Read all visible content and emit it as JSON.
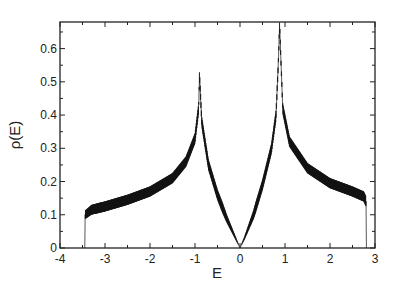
{
  "chart_data": {
    "type": "line",
    "title": "",
    "xlabel": "E",
    "ylabel": "ρ(E)",
    "xlim": [
      -4,
      3
    ],
    "ylim": [
      0,
      0.68
    ],
    "grid": false,
    "legend": null,
    "x_ticks": [
      -4,
      -3,
      -2,
      -1,
      0,
      1,
      2,
      3
    ],
    "x_tick_labels": [
      "-4",
      "-3",
      "-2",
      "-1",
      "0",
      "1",
      "2",
      "3"
    ],
    "y_ticks": [
      0,
      0.1,
      0.2,
      0.3,
      0.4,
      0.5,
      0.6
    ],
    "y_tick_labels": [
      "0",
      "0.1",
      "0.2",
      "0.3",
      "0.4",
      "0.5",
      "0.6"
    ],
    "series": [
      {
        "name": "ρ(E)",
        "color": "#111111",
        "style": "dense oscillating line (filled band)",
        "x": [
          -3.45,
          -3.44,
          -3.3,
          -3.0,
          -2.5,
          -2.0,
          -1.5,
          -1.2,
          -1.0,
          -0.92,
          -0.9,
          -0.85,
          -0.7,
          -0.5,
          -0.3,
          -0.1,
          0.0,
          0.1,
          0.3,
          0.5,
          0.7,
          0.8,
          0.85,
          0.88,
          0.95,
          1.1,
          1.5,
          2.0,
          2.5,
          2.75,
          2.8,
          2.81
        ],
        "y": [
          0.0,
          0.1,
          0.115,
          0.125,
          0.145,
          0.17,
          0.21,
          0.26,
          0.33,
          0.42,
          0.52,
          0.38,
          0.25,
          0.16,
          0.09,
          0.03,
          0.0,
          0.03,
          0.1,
          0.19,
          0.3,
          0.4,
          0.55,
          0.67,
          0.42,
          0.32,
          0.24,
          0.195,
          0.17,
          0.155,
          0.14,
          0.0
        ],
        "oscillation_amplitude": 0.03
      }
    ],
    "annotations": []
  },
  "axes": {
    "x_label": "E",
    "y_label": "ρ(E)"
  }
}
